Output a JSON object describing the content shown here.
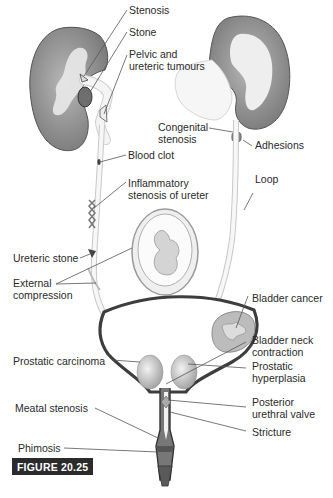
{
  "figure": {
    "caption": "FIGURE 20.25",
    "labels": {
      "stenosis": "Stenosis",
      "stone": "Stone",
      "pelvic_tumours": "Pelvic and\nureteric tumours",
      "congenital_stenosis": "Congenital\nstenosis",
      "adhesions": "Adhesions",
      "blood_clot": "Blood clot",
      "loop": "Loop",
      "inflammatory_stenosis": "Inflammatory\nstenosis of ureter",
      "ureteric_stone": "Ureteric stone",
      "external_compression": "External\ncompression",
      "bladder_cancer": "Bladder cancer",
      "bladder_neck_contraction": "Bladder neck\ncontraction",
      "prostatic_carcinoma": "Prostatic carcinoma",
      "prostatic_hyperplasia": "Prostatic\nhyperplasia",
      "posterior_urethral_valve": "Posterior\nurethral valve",
      "meatal_stenosis": "Meatal stenosis",
      "stricture": "Stricture",
      "phimosis": "Phimosis"
    },
    "colors": {
      "kidney_cortex": "#8c8c8c",
      "kidney_medulla": "#e6e6e6",
      "outline": "#3a3a3a",
      "caption_bg": "#2b2b2b",
      "caption_text": "#ffffff"
    }
  }
}
